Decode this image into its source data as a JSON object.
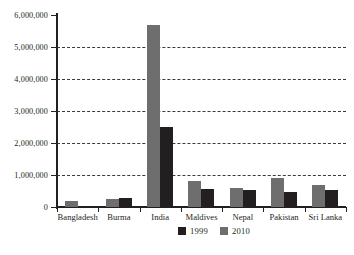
{
  "chart_data": {
    "type": "bar",
    "title": "",
    "xlabel": "",
    "ylabel": "",
    "categories": [
      "Bangladesh",
      "Burma",
      "India",
      "Maldives",
      "Nepal",
      "Pakistan",
      "Sri Lanka"
    ],
    "series": [
      {
        "name": "1999",
        "color": "#231f20",
        "values": [
          0,
          280000,
          2500000,
          550000,
          520000,
          470000,
          530000
        ]
      },
      {
        "name": "2010",
        "color": "#6e6e6e",
        "values": [
          190000,
          250000,
          5700000,
          800000,
          600000,
          900000,
          700000
        ]
      }
    ],
    "ylim": [
      0,
      6000000
    ],
    "ytick_values": [
      0,
      1000000,
      2000000,
      3000000,
      4000000,
      5000000,
      6000000
    ],
    "ytick_labels": [
      "0",
      "1,000,000",
      "2,000,000",
      "3,000,000",
      "4,000,000",
      "5,000,000",
      "6,000,000"
    ],
    "grid": "horizontal-dashed",
    "legend_position": "bottom-center",
    "bar_order_in_group": [
      "2010",
      "1999"
    ]
  },
  "legend": {
    "items": [
      {
        "label": "1999",
        "color": "#231f20"
      },
      {
        "label": "2010",
        "color": "#6e6e6e"
      }
    ]
  },
  "caption": {
    "ghost_text": ""
  }
}
